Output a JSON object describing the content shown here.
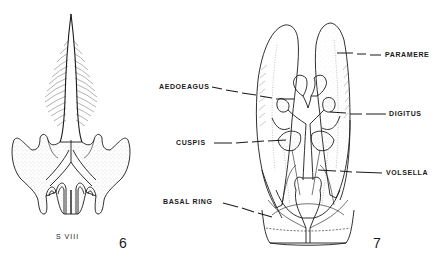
{
  "figures": [
    {
      "number": "6",
      "caption": "S VIII",
      "description": "Eighth sternite with median spinose process"
    },
    {
      "number": "7",
      "labels": {
        "paramere": "PARAMERE",
        "aedoeagus": "AEDOEAGUS",
        "digitus": "DIGITUS",
        "cuspis": "CUSPIS",
        "volsella": "VOLSELLA",
        "basal_ring": "BASAL RING"
      },
      "description": "Male genital capsule, ventral view"
    }
  ],
  "colors": {
    "ink": "#1a1a1a",
    "stipple": "#9a9a9a",
    "background": "#ffffff"
  }
}
